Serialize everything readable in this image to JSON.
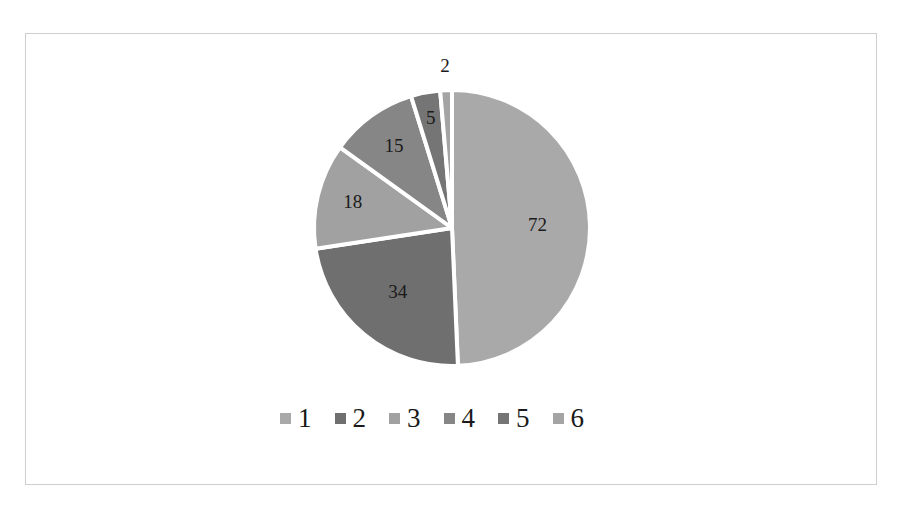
{
  "chart_data": {
    "type": "pie",
    "title": "",
    "categories": [
      "1",
      "2",
      "3",
      "4",
      "5",
      "6"
    ],
    "values": [
      72,
      34,
      18,
      15,
      5,
      2
    ],
    "colors": [
      "#a9a9a9",
      "#6f6f6f",
      "#a1a1a1",
      "#868686",
      "#757575",
      "#a4a4a4"
    ],
    "data_labels": [
      "72",
      "34",
      "18",
      "15",
      "5",
      "2"
    ],
    "start_angle_deg": 0,
    "direction": "clockwise",
    "legend_position": "bottom",
    "slice_separator_color": "#ffffff"
  },
  "legend": {
    "items": [
      {
        "label": "1",
        "color": "#a9a9a9"
      },
      {
        "label": "2",
        "color": "#6f6f6f"
      },
      {
        "label": "3",
        "color": "#a1a1a1"
      },
      {
        "label": "4",
        "color": "#868686"
      },
      {
        "label": "5",
        "color": "#757575"
      },
      {
        "label": "6",
        "color": "#a4a4a4"
      }
    ]
  }
}
